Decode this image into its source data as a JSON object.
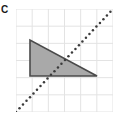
{
  "figure": {
    "label": "C",
    "label_name": "figure-label-c"
  },
  "colors": {
    "grid_line": "#e3e3e3",
    "grid_background": "#ffffff",
    "shape_fill": "#a9a9a9",
    "shape_stroke": "#4a4a4a",
    "mirror_line": "#3b3b3b",
    "label_text": "#1a1a1a"
  },
  "chart_data": {
    "type": "scatter",
    "title": "C",
    "xlabel": "",
    "ylabel": "",
    "grid": true,
    "legend": null,
    "axis_visible": false,
    "tick_labels": [],
    "xlim": [
      0,
      6
    ],
    "ylim": [
      0,
      6
    ],
    "grid_columns": 6,
    "grid_rows": 6,
    "cell_size_px": 16.2,
    "shapes": [
      {
        "name": "triangle",
        "kind": "polygon",
        "fill": "#a9a9a9",
        "stroke": "#4a4a4a",
        "stroke_width": 1.6,
        "vertices_grid": [
          [
            0.9,
            4.45
          ],
          [
            0.9,
            2.2
          ],
          [
            5.05,
            2.2
          ]
        ],
        "vertices_px": [
          [
            14,
            31
          ],
          [
            14,
            67
          ],
          [
            81,
            67
          ]
        ],
        "description": "right triangle, right angle at bottom-left"
      }
    ],
    "lines": [
      {
        "name": "mirror-line",
        "kind": "dotted-diagonal",
        "color": "#3b3b3b",
        "style": "dotted",
        "dot_radius_px": 1.25,
        "dot_spacing_px": 5.1,
        "from_grid": [
          0.0,
          0.0
        ],
        "to_grid": [
          6.0,
          6.0
        ],
        "from_px": [
          0,
          103
        ],
        "to_px": [
          97,
          0
        ],
        "slope": 1,
        "description": "dotted line of reflection from bottom-left to top-right"
      }
    ]
  }
}
